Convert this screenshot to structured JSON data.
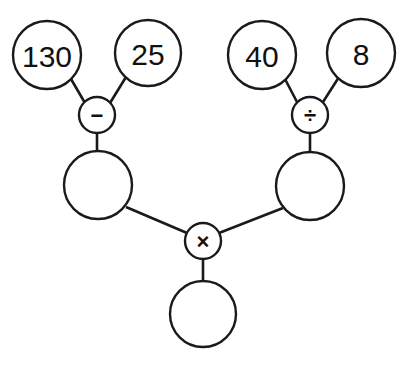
{
  "diagram": {
    "type": "expression-tree",
    "background_color": "#ffffff",
    "stroke_color": "#1a1a1a",
    "nodes": [
      {
        "id": "n130",
        "label": "130",
        "kind": "operand",
        "cx": 47,
        "cy": 55,
        "r": 34,
        "filled": false
      },
      {
        "id": "n25",
        "label": "25",
        "kind": "operand",
        "cx": 148,
        "cy": 53,
        "r": 33,
        "filled": false
      },
      {
        "id": "opMinus",
        "label": "−",
        "kind": "operator",
        "cx": 97,
        "cy": 115,
        "r": 18,
        "filled": false
      },
      {
        "id": "resLeft",
        "label": "",
        "kind": "result",
        "cx": 98,
        "cy": 185,
        "r": 34,
        "filled": false
      },
      {
        "id": "n40",
        "label": "40",
        "kind": "operand",
        "cx": 262,
        "cy": 55,
        "r": 34,
        "filled": false
      },
      {
        "id": "n8",
        "label": "8",
        "kind": "operand",
        "cx": 361,
        "cy": 53,
        "r": 34,
        "filled": false
      },
      {
        "id": "opDivide",
        "label": "÷",
        "kind": "operator",
        "cx": 310,
        "cy": 115,
        "r": 18,
        "filled": false
      },
      {
        "id": "resRight",
        "label": "",
        "kind": "result",
        "cx": 310,
        "cy": 186,
        "r": 34,
        "filled": false
      },
      {
        "id": "opTimes",
        "label": "×",
        "kind": "operator",
        "cx": 203,
        "cy": 241,
        "r": 18,
        "filled": false
      },
      {
        "id": "resBottom",
        "label": "",
        "kind": "result",
        "cx": 203,
        "cy": 314,
        "r": 33,
        "filled": false
      }
    ],
    "edges": [
      {
        "id": "e1",
        "from": "n130",
        "to": "opMinus",
        "x1": 71,
        "y1": 79,
        "x2": 85,
        "y2": 103
      },
      {
        "id": "e2",
        "from": "n25",
        "to": "opMinus",
        "x1": 126,
        "y1": 77,
        "x2": 110,
        "y2": 103
      },
      {
        "id": "e3",
        "from": "opMinus",
        "to": "resLeft",
        "x1": 97,
        "y1": 133,
        "x2": 97,
        "y2": 152
      },
      {
        "id": "e4",
        "from": "n40",
        "to": "opDivide",
        "x1": 285,
        "y1": 79,
        "x2": 297,
        "y2": 102
      },
      {
        "id": "e5",
        "from": "n8",
        "to": "opDivide",
        "x1": 339,
        "y1": 77,
        "x2": 323,
        "y2": 102
      },
      {
        "id": "e6",
        "from": "opDivide",
        "to": "resRight",
        "x1": 310,
        "y1": 133,
        "x2": 310,
        "y2": 153
      },
      {
        "id": "e7",
        "from": "resLeft",
        "to": "opTimes",
        "x1": 126,
        "y1": 207,
        "x2": 187,
        "y2": 233
      },
      {
        "id": "e8",
        "from": "resRight",
        "to": "opTimes",
        "x1": 283,
        "y1": 208,
        "x2": 219,
        "y2": 233
      },
      {
        "id": "e9",
        "from": "opTimes",
        "to": "resBottom",
        "x1": 203,
        "y1": 259,
        "x2": 203,
        "y2": 281
      }
    ]
  }
}
